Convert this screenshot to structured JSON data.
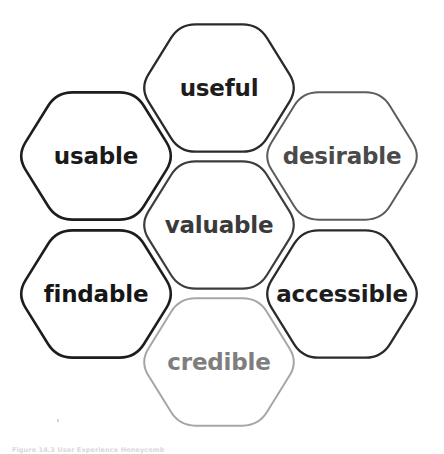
{
  "figure": {
    "type": "diagram",
    "diagram_kind": "honeycomb",
    "title": "User Experience Honeycomb",
    "caption": "Figure 14.3 User Experience Honeycomb",
    "background_color": "#ffffff",
    "cells": [
      {
        "id": "usable",
        "label": "usable",
        "position": "upper-left",
        "cx": 96,
        "cy": 156,
        "stroke_color": "#1d1d1d",
        "text_color": "#1a1a1a",
        "stroke_width": 2.6,
        "font_size": 23
      },
      {
        "id": "useful",
        "label": "useful",
        "position": "top-center",
        "cx": 219,
        "cy": 88,
        "stroke_color": "#2a2a2a",
        "text_color": "#1d1d1d",
        "stroke_width": 2.3,
        "font_size": 23
      },
      {
        "id": "desirable",
        "label": "desirable",
        "position": "upper-right",
        "cx": 342,
        "cy": 156,
        "stroke_color": "#5c5c5c",
        "text_color": "#4a4a4a",
        "stroke_width": 2.0,
        "font_size": 23
      },
      {
        "id": "valuable",
        "label": "valuable",
        "position": "center",
        "cx": 219,
        "cy": 225,
        "stroke_color": "#3d3d3d",
        "text_color": "#3a3a3a",
        "stroke_width": 2.2,
        "font_size": 23
      },
      {
        "id": "findable",
        "label": "findable",
        "position": "lower-left",
        "cx": 96,
        "cy": 294,
        "stroke_color": "#1d1d1d",
        "text_color": "#161616",
        "stroke_width": 2.6,
        "font_size": 23
      },
      {
        "id": "accessible",
        "label": "accessible",
        "position": "lower-right",
        "cx": 342,
        "cy": 294,
        "stroke_color": "#2a2a2a",
        "text_color": "#1d1d1d",
        "stroke_width": 2.3,
        "font_size": 23
      },
      {
        "id": "credible",
        "label": "credible",
        "position": "bottom-center",
        "cx": 219,
        "cy": 362,
        "stroke_color": "#a6a6a6",
        "text_color": "#7e7e7e",
        "stroke_width": 2.0,
        "font_size": 23
      }
    ]
  }
}
